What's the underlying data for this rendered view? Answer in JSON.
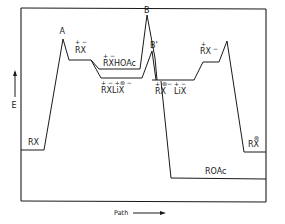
{
  "diagram": {
    "type": "reaction-energy-profile",
    "y_axis_label": "E",
    "x_axis_label": "Path",
    "transition_states": {
      "A": "A",
      "B": "B",
      "B_prime": "B'"
    },
    "species": {
      "reactant": "RX",
      "ion_pair": {
        "text": "RX",
        "charges": "+ −"
      },
      "ion_pair_hoac": {
        "text": "RXHOAc",
        "charges": "+     −"
      },
      "ion_pair_lix": {
        "text": "RXLiX",
        "charges": "+ −  +⊛ −"
      },
      "free_ions": {
        "text": "RX",
        "charges": "+ ⊛−"
      },
      "lix_ions": {
        "text": "LiX",
        "charges": "+    −"
      },
      "rx_minus": {
        "text": "RX",
        "charges": "+",
        "suffix": "−"
      },
      "product_rx_star": {
        "text": "RX",
        "charges": "⊛"
      },
      "product_roac": "ROAc"
    }
  }
}
